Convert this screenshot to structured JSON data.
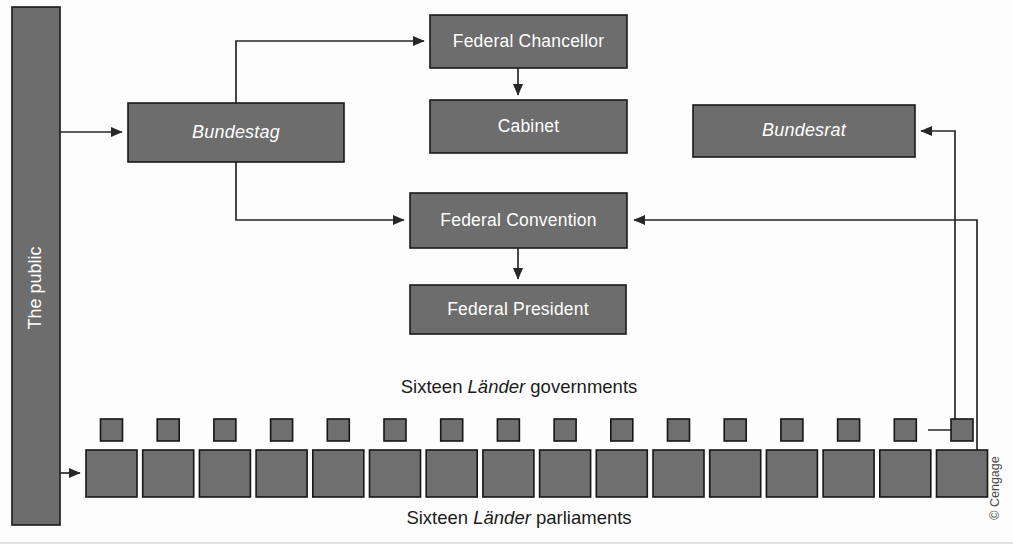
{
  "diagram": {
    "colors": {
      "box_fill": "#6d6d6d",
      "box_stroke": "#1a1a1a",
      "connector": "#272727",
      "box_text": "#ffffff",
      "label_text": "#1b1b1b",
      "background": "#fdfdfd"
    },
    "public_bar": {
      "label": "The public"
    },
    "boxes": {
      "bundestag": {
        "label": "Bundestag",
        "style": "italic"
      },
      "federal_chancellor": {
        "label": "Federal Chancellor",
        "style": "normal"
      },
      "cabinet": {
        "label": "Cabinet",
        "style": "normal"
      },
      "federal_convention": {
        "label": "Federal Convention",
        "style": "normal"
      },
      "federal_president": {
        "label": "Federal President",
        "style": "normal"
      },
      "bundesrat": {
        "label": "Bundesrat",
        "style": "italic"
      }
    },
    "row_labels": {
      "governments": {
        "prefix": "Sixteen ",
        "italic": "Länder",
        "suffix": " governments"
      },
      "parliaments": {
        "prefix": "Sixteen ",
        "italic": "Länder",
        "suffix": " parliaments"
      }
    },
    "lander": {
      "count": 16,
      "government_squares": 16,
      "parliament_squares": 16
    },
    "credit": "© Cengage"
  }
}
